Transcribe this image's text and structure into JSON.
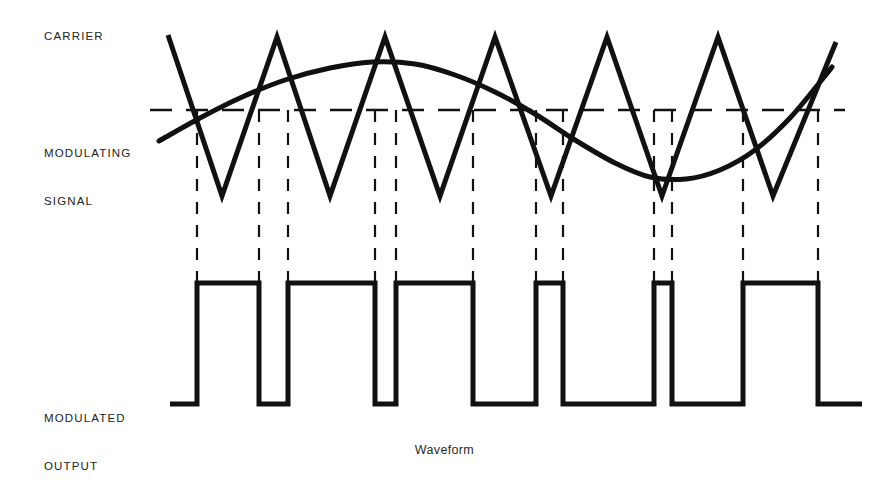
{
  "figure": {
    "caption": "Waveform",
    "background_color": "#ffffff",
    "stroke_color": "#111111"
  },
  "labels": {
    "carrier": "CARRIER",
    "modulating_line1": "MODULATING",
    "modulating_line2": "SIGNAL",
    "modulated_line1": "MODULATED",
    "modulated_line2": "OUTPUT"
  },
  "chart_data": {
    "type": "line",
    "title": "Waveform",
    "subtitle": "",
    "xlabel": "",
    "ylabel": "",
    "grid": false,
    "legend_position": "left-labels",
    "axis_ranges": {
      "x": [
        160,
        840
      ],
      "y_top_panel": [
        30,
        200
      ],
      "y_bottom_panel": [
        283,
        404
      ]
    },
    "reference_line": {
      "name": "zero-reference",
      "y": 110,
      "x_start": 150,
      "x_end": 845,
      "style": "dashed"
    },
    "series": [
      {
        "name": "CARRIER",
        "waveform": "triangle",
        "style": "solid",
        "stroke_width": 5,
        "peak_y": 37,
        "valley_y": 196,
        "points": [
          [
            168,
            35
          ],
          [
            222,
            196
          ],
          [
            277,
            37
          ],
          [
            330,
            196
          ],
          [
            385,
            37
          ],
          [
            440,
            196
          ],
          [
            495,
            37
          ],
          [
            551,
            196
          ],
          [
            607,
            37
          ],
          [
            662,
            196
          ],
          [
            718,
            37
          ],
          [
            773,
            196
          ],
          [
            836,
            42
          ]
        ]
      },
      {
        "name": "MODULATING SIGNAL",
        "waveform": "sine",
        "style": "solid",
        "stroke_width": 5,
        "peak_y": 62,
        "trough_y": 179,
        "zero_y": 120,
        "points": [
          [
            159,
            141
          ],
          [
            200,
            118
          ],
          [
            240,
            98
          ],
          [
            285,
            80
          ],
          [
            330,
            68
          ],
          [
            372,
            62
          ],
          [
            415,
            64
          ],
          [
            455,
            75
          ],
          [
            495,
            92
          ],
          [
            535,
            114
          ],
          [
            575,
            140
          ],
          [
            615,
            163
          ],
          [
            650,
            177
          ],
          [
            686,
            179
          ],
          [
            720,
            170
          ],
          [
            755,
            150
          ],
          [
            790,
            118
          ],
          [
            820,
            82
          ],
          [
            832,
            67
          ]
        ]
      },
      {
        "name": "MODULATED OUTPUT",
        "waveform": "square",
        "style": "solid",
        "stroke_width": 5,
        "high_y": 283,
        "low_y": 404,
        "x_start": 170,
        "x_end": 862,
        "transitions": [
          197,
          259,
          288,
          375,
          396,
          473,
          536,
          563,
          654,
          672,
          743,
          818
        ],
        "pulses": [
          {
            "rise": 197,
            "fall": 259,
            "width": 62
          },
          {
            "rise": 288,
            "fall": 375,
            "width": 87
          },
          {
            "rise": 396,
            "fall": 473,
            "width": 77
          },
          {
            "rise": 536,
            "fall": 563,
            "width": 27
          },
          {
            "rise": 672,
            "fall": 743,
            "width": 71
          },
          {
            "rise": 743,
            "fall": 818,
            "width": 75
          }
        ]
      }
    ],
    "projection_lines": {
      "name": "dashed-projection-lines",
      "style": "dashed",
      "y_top": 110,
      "y_bottom": 283,
      "x_positions": [
        197,
        259,
        288,
        375,
        396,
        473,
        536,
        563,
        654,
        672,
        743,
        818
      ]
    }
  }
}
